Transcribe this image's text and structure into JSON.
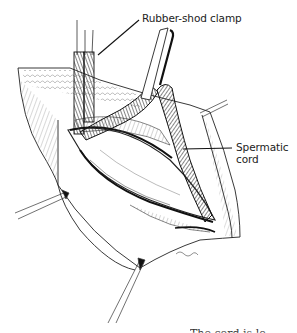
{
  "figure": {
    "type": "surgical line illustration",
    "background": "#ffffff",
    "ink_color": "#1a1a1a",
    "labels": {
      "clamp": "Rubber-shod clamp",
      "cord_line1": "Spermatic",
      "cord_line2": "cord"
    },
    "caption_partial": "The cord is lo"
  }
}
